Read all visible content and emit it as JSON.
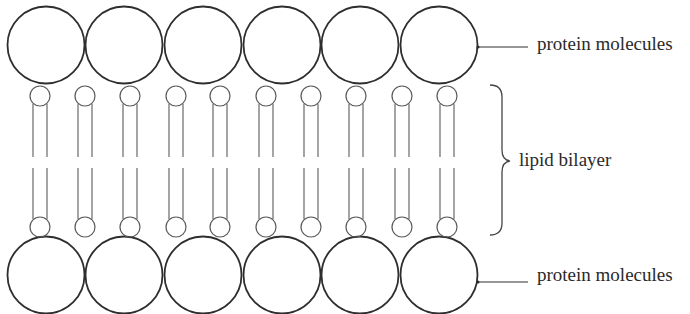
{
  "diagram": {
    "labels": {
      "top_protein": "protein molecules",
      "lipid": "lipid bilayer",
      "bottom_protein": "protein molecules"
    },
    "colors": {
      "protein_stroke": "#2e2e2e",
      "lipid_stroke": "#5a5a5a",
      "text": "#2a2a2a"
    },
    "protein_circles_top": [
      46,
      124,
      203,
      282,
      360,
      439
    ],
    "protein_circles_bottom": [
      46,
      124,
      203,
      282,
      360,
      439
    ],
    "lipid_heads_x": [
      40,
      85,
      130,
      176,
      220,
      266,
      311,
      356,
      402,
      447
    ]
  }
}
